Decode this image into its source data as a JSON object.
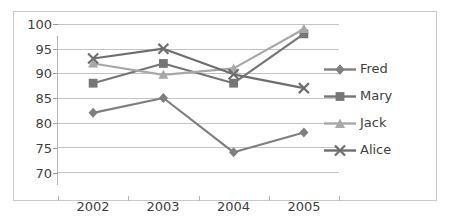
{
  "chart_data": {
    "type": "line",
    "title": "",
    "xlabel": "",
    "ylabel": "",
    "categories": [
      "2002",
      "2003",
      "2004",
      "2005"
    ],
    "yticks": [
      70,
      75,
      80,
      85,
      90,
      95,
      100
    ],
    "ylim": [
      70,
      100
    ],
    "grid": true,
    "legend_position": "right",
    "series": [
      {
        "name": "Fred",
        "marker": "diamond",
        "color": "#7f7f7f",
        "values": [
          82,
          85,
          74,
          78
        ]
      },
      {
        "name": "Mary",
        "marker": "square",
        "color": "#767676",
        "values": [
          88,
          92,
          88,
          98
        ]
      },
      {
        "name": "Jack",
        "marker": "triangle",
        "color": "#a8a8a8",
        "values": [
          92,
          89.7,
          91,
          99
        ]
      },
      {
        "name": "Alice",
        "marker": "x",
        "color": "#6e6e6e",
        "values": [
          93,
          95,
          89.8,
          87
        ]
      }
    ]
  },
  "axes": {
    "y_tick_labels": [
      "100",
      "95",
      "90",
      "85",
      "80",
      "75",
      "70"
    ],
    "x_tick_labels": [
      "2002",
      "2003",
      "2004",
      "2005"
    ]
  },
  "legend": {
    "items": [
      {
        "label": "Fred"
      },
      {
        "label": "Mary"
      },
      {
        "label": "Jack"
      },
      {
        "label": "Alice"
      }
    ]
  },
  "colors": {
    "grid": "#c4c4c4",
    "frame": "#c9c9c9",
    "text": "#3f3f3f",
    "background": "#ffffff"
  }
}
